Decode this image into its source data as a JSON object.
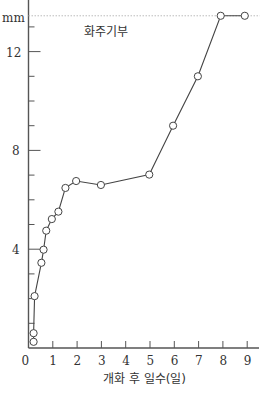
{
  "chart_data": {
    "type": "line",
    "title": "",
    "xlabel": "개화 후 일수(일)",
    "ylabel": "mm",
    "xlim": [
      0,
      9.4
    ],
    "ylim": [
      0,
      14
    ],
    "x_ticks": [
      0,
      1,
      2,
      3,
      4,
      5,
      6,
      7,
      8,
      9
    ],
    "y_ticks_major": [
      4,
      8,
      12
    ],
    "y_ticks_minor_step": 1,
    "grid": false,
    "legend": null,
    "annotations": [
      {
        "text": "화주기부",
        "x": 2.4,
        "y": 12.7
      },
      {
        "type": "dotted-hline",
        "y": 13.45,
        "from_x": 0,
        "to_x": 8.9
      }
    ],
    "series": [
      {
        "name": "화주기부",
        "marker": "open-circle",
        "x": [
          0.21,
          0.21,
          0.25,
          0.53,
          0.62,
          0.73,
          0.96,
          1.23,
          1.52,
          1.96,
          2.98,
          4.97,
          5.95,
          6.97,
          7.91,
          8.9
        ],
        "y": [
          0.25,
          0.6,
          2.1,
          3.45,
          3.98,
          4.75,
          5.22,
          5.52,
          6.48,
          6.76,
          6.6,
          7.02,
          9.0,
          11.0,
          13.45,
          13.45
        ]
      }
    ]
  },
  "labels": {
    "y_unit": "mm",
    "annotation": "화주기부",
    "x_axis_title": "개화 후 일수(일)"
  }
}
